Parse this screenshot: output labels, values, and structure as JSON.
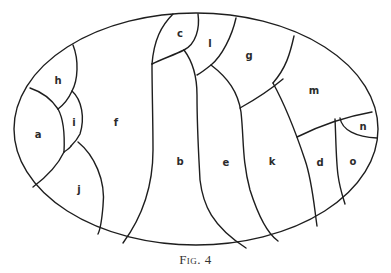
{
  "figure": {
    "caption_prefix": "Fig.",
    "caption_number": "4",
    "regions": [
      {
        "id": "a",
        "label": "a",
        "x": 38,
        "y": 135
      },
      {
        "id": "b",
        "label": "b",
        "x": 180,
        "y": 160
      },
      {
        "id": "c",
        "label": "c",
        "x": 180,
        "y": 34
      },
      {
        "id": "d",
        "label": "d",
        "x": 320,
        "y": 163
      },
      {
        "id": "e",
        "label": "e",
        "x": 226,
        "y": 161
      },
      {
        "id": "f",
        "label": "f",
        "x": 116,
        "y": 122
      },
      {
        "id": "g",
        "label": "g",
        "x": 249,
        "y": 56
      },
      {
        "id": "h",
        "label": "h",
        "x": 58,
        "y": 81
      },
      {
        "id": "i",
        "label": "i",
        "x": 74,
        "y": 123
      },
      {
        "id": "j",
        "label": "j",
        "x": 79,
        "y": 190
      },
      {
        "id": "k",
        "label": "k",
        "x": 272,
        "y": 161
      },
      {
        "id": "l",
        "label": "l",
        "x": 210,
        "y": 44
      },
      {
        "id": "m",
        "label": "m",
        "x": 314,
        "y": 91
      },
      {
        "id": "n",
        "label": "n",
        "x": 363,
        "y": 126
      },
      {
        "id": "o",
        "label": "o",
        "x": 353,
        "y": 162
      }
    ]
  }
}
